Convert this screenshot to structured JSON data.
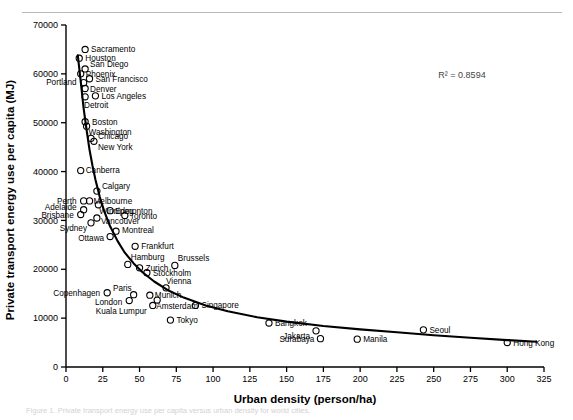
{
  "figure": {
    "caption": "Figure 1. Private transport energy use per capita versus urban density for world cities.",
    "r2_label": "R² = 0.8594"
  },
  "chart_data": {
    "type": "scatter",
    "title": "",
    "xlabel": "Urban density (person/ha)",
    "ylabel": "Private transport energy use per capita (MJ)",
    "xlim": [
      0,
      325
    ],
    "ylim": [
      0,
      70000
    ],
    "xticks": [
      0,
      25,
      50,
      75,
      100,
      125,
      150,
      175,
      200,
      225,
      250,
      275,
      300,
      325
    ],
    "yticks": [
      0,
      10000,
      20000,
      30000,
      40000,
      50000,
      60000,
      70000
    ],
    "grid": false,
    "legend": null,
    "annotations": [
      "R² = 0.8594"
    ],
    "points": [
      {
        "name": "Sacramento",
        "x": 13,
        "y": 65000,
        "lx": 6,
        "ly": 3,
        "anchor": "start"
      },
      {
        "name": "Houston",
        "x": 9,
        "y": 63200,
        "lx": 6,
        "ly": 3,
        "anchor": "start"
      },
      {
        "name": "San Diego",
        "x": 13,
        "y": 61000,
        "lx": 5,
        "ly": -2,
        "anchor": "start"
      },
      {
        "name": "Phoenix",
        "x": 10,
        "y": 60000,
        "lx": 5,
        "ly": 3,
        "anchor": "start"
      },
      {
        "name": "San Francisco",
        "x": 16,
        "y": 59000,
        "lx": 6,
        "ly": 3,
        "anchor": "start"
      },
      {
        "name": "Portland",
        "x": 12,
        "y": 58200,
        "lx": -7,
        "ly": 2,
        "anchor": "end"
      },
      {
        "name": "Denver",
        "x": 13,
        "y": 57000,
        "lx": 5,
        "ly": 3,
        "anchor": "start"
      },
      {
        "name": "Los Angeles",
        "x": 20,
        "y": 55500,
        "lx": 6,
        "ly": 3,
        "anchor": "start"
      },
      {
        "name": "Detroit",
        "x": 13,
        "y": 55300,
        "lx": -1,
        "ly": 11,
        "anchor": "start"
      },
      {
        "name": "Boston",
        "x": 13,
        "y": 50200,
        "lx": 7,
        "ly": 3,
        "anchor": "start"
      },
      {
        "name": "Washington",
        "x": 14,
        "y": 49300,
        "lx": 2,
        "ly": 9,
        "anchor": "start"
      },
      {
        "name": "Chicago",
        "x": 17,
        "y": 46800,
        "lx": 7,
        "ly": 1,
        "anchor": "start"
      },
      {
        "name": "New York",
        "x": 19,
        "y": 46200,
        "lx": 4,
        "ly": 9,
        "anchor": "start"
      },
      {
        "name": "Canberra",
        "x": 10,
        "y": 40200,
        "lx": 5,
        "ly": 2,
        "anchor": "start"
      },
      {
        "name": "Calgary",
        "x": 21,
        "y": 36000,
        "lx": 5,
        "ly": -2,
        "anchor": "start"
      },
      {
        "name": "Perth",
        "x": 12,
        "y": 34000,
        "lx": -7,
        "ly": 3,
        "anchor": "end"
      },
      {
        "name": "Melbourne",
        "x": 16,
        "y": 34000,
        "lx": 4,
        "ly": 3,
        "anchor": "start"
      },
      {
        "name": "Winnipeg",
        "x": 22,
        "y": 33200,
        "lx": 1,
        "ly": 9,
        "anchor": "start"
      },
      {
        "name": "Adelaide",
        "x": 12,
        "y": 32200,
        "lx": -7,
        "ly": 0,
        "anchor": "end"
      },
      {
        "name": "Edmonton",
        "x": 30,
        "y": 32000,
        "lx": 5,
        "ly": 3,
        "anchor": "start"
      },
      {
        "name": "Brisbane",
        "x": 10,
        "y": 31200,
        "lx": -7,
        "ly": 3,
        "anchor": "end"
      },
      {
        "name": "Toronto",
        "x": 40,
        "y": 31000,
        "lx": 5,
        "ly": 3,
        "anchor": "start"
      },
      {
        "name": "Vancouver",
        "x": 21,
        "y": 30500,
        "lx": 4,
        "ly": 6,
        "anchor": "start"
      },
      {
        "name": "Sydney",
        "x": 17,
        "y": 29500,
        "lx": -4,
        "ly": 8,
        "anchor": "end"
      },
      {
        "name": "Montreal",
        "x": 34,
        "y": 27800,
        "lx": 6,
        "ly": 2,
        "anchor": "start"
      },
      {
        "name": "Ottawa",
        "x": 30,
        "y": 26700,
        "lx": -6,
        "ly": 4,
        "anchor": "end"
      },
      {
        "name": "Frankfurt",
        "x": 47,
        "y": 24700,
        "lx": 6,
        "ly": 3,
        "anchor": "start"
      },
      {
        "name": "Hamburg",
        "x": 42,
        "y": 21000,
        "lx": 3,
        "ly": -4,
        "anchor": "start"
      },
      {
        "name": "Brussels",
        "x": 74,
        "y": 20800,
        "lx": 3,
        "ly": -4,
        "anchor": "start"
      },
      {
        "name": "Zurich",
        "x": 50,
        "y": 20300,
        "lx": 6,
        "ly": 3,
        "anchor": "start"
      },
      {
        "name": "Stockholm",
        "x": 55,
        "y": 19300,
        "lx": 6,
        "ly": 3,
        "anchor": "start"
      },
      {
        "name": "Vienna",
        "x": 68,
        "y": 16200,
        "lx": 0,
        "ly": -4,
        "anchor": "start"
      },
      {
        "name": "Copenhagen",
        "x": 28,
        "y": 15200,
        "lx": -7,
        "ly": 3,
        "anchor": "end"
      },
      {
        "name": "Paris",
        "x": 46,
        "y": 14800,
        "lx": -2,
        "ly": -4,
        "anchor": "end"
      },
      {
        "name": "Munich",
        "x": 57,
        "y": 14700,
        "lx": 5,
        "ly": 3,
        "anchor": "start"
      },
      {
        "name": "Amsterdam",
        "x": 62,
        "y": 13700,
        "lx": -1,
        "ly": 9,
        "anchor": "start"
      },
      {
        "name": "London",
        "x": 43,
        "y": 13600,
        "lx": -7,
        "ly": 4,
        "anchor": "end"
      },
      {
        "name": "Kuala Lumpur",
        "x": 59,
        "y": 12600,
        "lx": -6,
        "ly": 9,
        "anchor": "end"
      },
      {
        "name": "Singapore",
        "x": 88,
        "y": 12600,
        "lx": 6,
        "ly": 3,
        "anchor": "start"
      },
      {
        "name": "Tokyo",
        "x": 71,
        "y": 9600,
        "lx": 6,
        "ly": 3,
        "anchor": "start"
      },
      {
        "name": "Bangkok",
        "x": 138,
        "y": 9000,
        "lx": 6,
        "ly": 3,
        "anchor": "start"
      },
      {
        "name": "Seoul",
        "x": 243,
        "y": 7600,
        "lx": 6,
        "ly": 3,
        "anchor": "start"
      },
      {
        "name": "Jakarta",
        "x": 170,
        "y": 7400,
        "lx": -6,
        "ly": 8,
        "anchor": "end"
      },
      {
        "name": "Surabaya",
        "x": 173,
        "y": 5800,
        "lx": -6,
        "ly": 3,
        "anchor": "end"
      },
      {
        "name": "Manila",
        "x": 198,
        "y": 5700,
        "lx": 6,
        "ly": 3,
        "anchor": "start"
      },
      {
        "name": "Hong Kong",
        "x": 300,
        "y": 5000,
        "lx": 6,
        "ly": 3,
        "anchor": "start"
      }
    ],
    "trendline": {
      "description": "power-law best fit curve",
      "points": [
        {
          "x": 8,
          "y": 63800
        },
        {
          "x": 10,
          "y": 58500
        },
        {
          "x": 12,
          "y": 53000
        },
        {
          "x": 14,
          "y": 48500
        },
        {
          "x": 16,
          "y": 44500
        },
        {
          "x": 18,
          "y": 41200
        },
        {
          "x": 20,
          "y": 38400
        },
        {
          "x": 23,
          "y": 34800
        },
        {
          "x": 26,
          "y": 31900
        },
        {
          "x": 30,
          "y": 28800
        },
        {
          "x": 35,
          "y": 25800
        },
        {
          "x": 40,
          "y": 23400
        },
        {
          "x": 46,
          "y": 21200
        },
        {
          "x": 52,
          "y": 19400
        },
        {
          "x": 60,
          "y": 17500
        },
        {
          "x": 70,
          "y": 15600
        },
        {
          "x": 80,
          "y": 14200
        },
        {
          "x": 95,
          "y": 12600
        },
        {
          "x": 110,
          "y": 11400
        },
        {
          "x": 130,
          "y": 10200
        },
        {
          "x": 150,
          "y": 9300
        },
        {
          "x": 175,
          "y": 8400
        },
        {
          "x": 200,
          "y": 7700
        },
        {
          "x": 225,
          "y": 7100
        },
        {
          "x": 250,
          "y": 6500
        },
        {
          "x": 275,
          "y": 6000
        },
        {
          "x": 300,
          "y": 5500
        },
        {
          "x": 320,
          "y": 5150
        }
      ]
    }
  }
}
